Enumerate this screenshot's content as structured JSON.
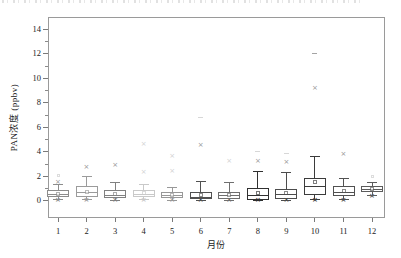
{
  "chart_data": {
    "type": "box",
    "title": "",
    "xlabel": "月份",
    "ylabel": "PAN浓度 (ppbv)",
    "x_tick_labels": [
      "1",
      "2",
      "3",
      "4",
      "5",
      "6",
      "7",
      "8",
      "9",
      "10",
      "11",
      "12"
    ],
    "y_tick_values": [
      0,
      2,
      4,
      6,
      8,
      10,
      12,
      14
    ],
    "y_minor_tick_values": [
      1,
      3,
      5,
      7,
      9,
      11,
      13
    ],
    "ylim": [
      -1.4,
      15.0
    ],
    "grid": false,
    "legend": "none",
    "frame": true,
    "boxes": [
      {
        "month": "1",
        "q1": 0.3,
        "median": 0.5,
        "q3": 0.85,
        "mean": 0.55,
        "whisker_low": 0.08,
        "whisker_high": 1.3,
        "min_marker": 0.03,
        "color": "#8c8c8c",
        "outliers": [
          {
            "value": 1.5,
            "marker": "x",
            "faint": false
          },
          {
            "value": 2.1,
            "marker": "square",
            "faint": true
          }
        ]
      },
      {
        "month": "2",
        "q1": 0.35,
        "median": 0.7,
        "q3": 1.2,
        "mean": 0.75,
        "whisker_low": 0.1,
        "whisker_high": 2.0,
        "min_marker": 0.03,
        "color": "#9b9b9b",
        "outliers": [
          {
            "value": 2.7,
            "marker": "x",
            "faint": false
          }
        ]
      },
      {
        "month": "3",
        "q1": 0.25,
        "median": 0.45,
        "q3": 0.85,
        "mean": 0.55,
        "whisker_low": 0.05,
        "whisker_high": 1.5,
        "min_marker": 0.03,
        "color": "#808080",
        "outliers": [
          {
            "value": 2.85,
            "marker": "x",
            "faint": false
          }
        ]
      },
      {
        "month": "4",
        "q1": 0.3,
        "median": 0.55,
        "q3": 0.9,
        "mean": 0.6,
        "whisker_low": 0.1,
        "whisker_high": 1.3,
        "min_marker": 0.05,
        "color": "#c9c9c9",
        "outliers": [
          {
            "value": 2.35,
            "marker": "x",
            "faint": true
          },
          {
            "value": 4.6,
            "marker": "x",
            "faint": true
          }
        ]
      },
      {
        "month": "5",
        "q1": 0.25,
        "median": 0.45,
        "q3": 0.75,
        "mean": 0.5,
        "whisker_low": 0.05,
        "whisker_high": 1.1,
        "min_marker": 0.03,
        "color": "#989898",
        "outliers": [
          {
            "value": 2.4,
            "marker": "x",
            "faint": true
          },
          {
            "value": 3.6,
            "marker": "x",
            "faint": true
          }
        ]
      },
      {
        "month": "6",
        "q1": 0.15,
        "median": 0.3,
        "q3": 0.7,
        "mean": 0.45,
        "whisker_low": 0.03,
        "whisker_high": 1.55,
        "min_marker": 0.02,
        "color": "#515151",
        "outliers": [
          {
            "value": 4.55,
            "marker": "x",
            "faint": false
          },
          {
            "value": 6.8,
            "marker": "dash",
            "faint": true
          }
        ]
      },
      {
        "month": "7",
        "q1": 0.15,
        "median": 0.4,
        "q3": 0.7,
        "mean": 0.5,
        "whisker_low": 0.05,
        "whisker_high": 1.5,
        "min_marker": 0.03,
        "color": "#6f6f6f",
        "outliers": [
          {
            "value": 3.2,
            "marker": "x",
            "faint": true
          }
        ]
      },
      {
        "month": "8",
        "q1": 0.1,
        "median": 0.45,
        "q3": 1.05,
        "mean": 0.65,
        "whisker_low": 0.02,
        "whisker_high": 2.4,
        "min_marker": 0.02,
        "color": "#303030",
        "outliers": [
          {
            "value": 3.2,
            "marker": "x",
            "faint": false
          },
          {
            "value": 4.0,
            "marker": "dash",
            "faint": true
          }
        ]
      },
      {
        "month": "9",
        "q1": 0.15,
        "median": 0.5,
        "q3": 1.0,
        "mean": 0.65,
        "whisker_low": 0.05,
        "whisker_high": 2.35,
        "min_marker": 0.03,
        "color": "#4c4c4c",
        "outliers": [
          {
            "value": 3.1,
            "marker": "x",
            "faint": false
          },
          {
            "value": 3.9,
            "marker": "dash",
            "faint": true
          }
        ]
      },
      {
        "month": "10",
        "q1": 0.5,
        "median": 1.15,
        "q3": 1.85,
        "mean": 1.55,
        "whisker_low": 0.1,
        "whisker_high": 3.65,
        "min_marker": 0.05,
        "color": "#3b3b3b",
        "outliers": [
          {
            "value": 9.15,
            "marker": "x",
            "faint": false
          },
          {
            "value": 12.05,
            "marker": "dash",
            "faint": false
          }
        ]
      },
      {
        "month": "11",
        "q1": 0.4,
        "median": 0.7,
        "q3": 1.2,
        "mean": 0.8,
        "whisker_low": 0.1,
        "whisker_high": 1.85,
        "min_marker": 0.05,
        "color": "#515151",
        "outliers": [
          {
            "value": 3.75,
            "marker": "x",
            "faint": false
          }
        ]
      },
      {
        "month": "12",
        "q1": 0.7,
        "median": 0.95,
        "q3": 1.2,
        "mean": 1.0,
        "whisker_low": 0.4,
        "whisker_high": 1.5,
        "min_marker": 0.35,
        "color": "#5c5c5c",
        "outliers": [
          {
            "value": 1.95,
            "marker": "square",
            "faint": true
          }
        ]
      }
    ]
  }
}
